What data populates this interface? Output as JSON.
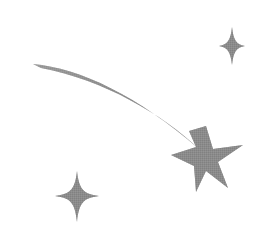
{
  "artwork": {
    "title": "Shooting Star",
    "alt_text": "Grayscale shooting star clipart with a tapered curved trail, a six-pointed star and two four-pointed sparkles",
    "canvas": {
      "width": 276,
      "height": 236,
      "background_color": "#ffffff"
    },
    "palette": {
      "ink": "#8a8a8a",
      "ink_dark": "#7b7b7b",
      "ink_light": "#a8a8a8",
      "ink_faint": "#c9c9c9",
      "background": "#ffffff"
    },
    "elements": [
      {
        "id": "trail",
        "name": "star-trail",
        "label": "Trail",
        "description": "Tapered curved motion trail sweeping from upper-left down to the main star",
        "start_point": [
          33,
          64
        ],
        "end_point": [
          196,
          146
        ],
        "max_thickness": 8,
        "fill": "#8a8a8a"
      },
      {
        "id": "main-star",
        "name": "main-star",
        "label": "Main star",
        "description": "Six-pointed star at the head of the trail",
        "points": 6,
        "center": [
          207,
          157
        ],
        "outer_radius": 36,
        "fill": "#8a8a8a"
      },
      {
        "id": "sparkle-top-right",
        "name": "sparkle-top-right",
        "label": "Top-right sparkle",
        "description": "Four-pointed sparkle in the upper-right area",
        "points": 4,
        "center": [
          232,
          46
        ],
        "radius_x": 12,
        "radius_y": 18,
        "fill": "#8a8a8a"
      },
      {
        "id": "sparkle-bottom-left",
        "name": "sparkle-bottom-left",
        "label": "Bottom-left sparkle",
        "description": "Four-pointed sparkle in the lower-left area",
        "points": 4,
        "center": [
          77,
          196
        ],
        "radius_x": 21,
        "radius_y": 25,
        "fill": "#8a8a8a"
      }
    ]
  }
}
